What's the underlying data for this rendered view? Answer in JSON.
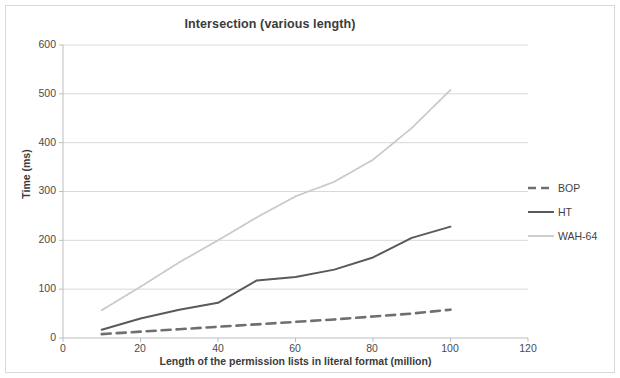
{
  "figure": {
    "title": "Intersection (various length)"
  },
  "axes": {
    "ylabel": "Time (ms)",
    "xlabel": "Length of the permission lists  in literal format (million)",
    "yticks": [
      "0",
      "100",
      "200",
      "300",
      "400",
      "500",
      "600"
    ],
    "xticks": [
      "0",
      "20",
      "40",
      "60",
      "80",
      "100",
      "120"
    ]
  },
  "legend": {
    "items": [
      {
        "label": "BOP",
        "color": "#6f6f6f",
        "dash": "8,5",
        "width": 2.4
      },
      {
        "label": "HT",
        "color": "#5a5a5a",
        "dash": "none",
        "width": 2.0
      },
      {
        "label": "WAH-64",
        "color": "#c9c9c9",
        "dash": "none",
        "width": 1.6
      }
    ]
  },
  "chart_data": {
    "type": "line",
    "title": "Intersection (various length)",
    "xlabel": "Length of the permission lists  in literal format (million)",
    "ylabel": "Time (ms)",
    "xlim": [
      0,
      120
    ],
    "ylim": [
      0,
      600
    ],
    "xticks": [
      0,
      20,
      40,
      60,
      80,
      100,
      120
    ],
    "yticks": [
      0,
      100,
      200,
      300,
      400,
      500,
      600
    ],
    "grid": "horizontal",
    "legend_position": "right",
    "x": [
      10,
      20,
      30,
      40,
      50,
      60,
      70,
      80,
      90,
      100
    ],
    "series": [
      {
        "name": "BOP",
        "style": "dashed",
        "color": "#6f6f6f",
        "values": [
          8,
          13,
          18,
          23,
          28,
          33,
          38,
          44,
          50,
          58
        ]
      },
      {
        "name": "HT",
        "style": "solid",
        "color": "#5a5a5a",
        "values": [
          17,
          40,
          58,
          72,
          118,
          125,
          140,
          165,
          205,
          228
        ]
      },
      {
        "name": "WAH-64",
        "style": "dotted",
        "color": "#c9c9c9",
        "values": [
          57,
          105,
          155,
          200,
          247,
          290,
          320,
          365,
          430,
          508
        ]
      }
    ]
  }
}
